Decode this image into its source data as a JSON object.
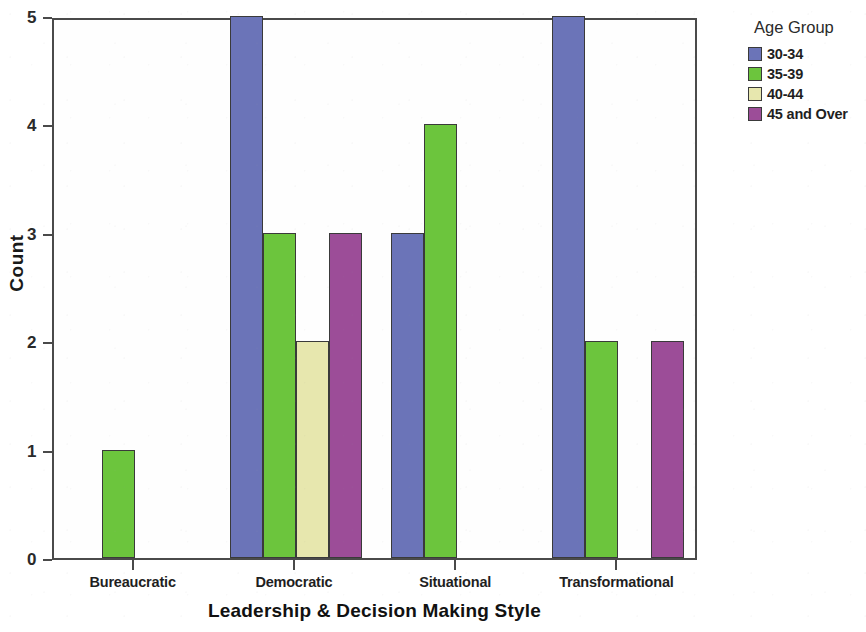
{
  "chart_data": {
    "type": "bar",
    "title": "",
    "subtitle": "",
    "xlabel": "Leadership & Decision Making Style",
    "ylabel": "Count",
    "categories": [
      "Bureaucratic",
      "Democratic",
      "Situational",
      "Transformational"
    ],
    "series": [
      {
        "name": "30-34",
        "color": "#6b74b8",
        "values": [
          0,
          5,
          3,
          5
        ]
      },
      {
        "name": "35-39",
        "color": "#6cc53d",
        "values": [
          1,
          3,
          4,
          2
        ]
      },
      {
        "name": "40-44",
        "color": "#e7e7ae",
        "values": [
          0,
          2,
          0,
          0
        ]
      },
      {
        "name": "45 and Over",
        "color": "#9c4d98",
        "values": [
          0,
          3,
          0,
          2
        ]
      }
    ],
    "ylim": [
      0,
      5
    ],
    "yticks": [
      0,
      1,
      2,
      3,
      4,
      5
    ],
    "ytick_labels": [
      "0",
      "1",
      "2",
      "3",
      "4",
      "5"
    ],
    "grid": false,
    "legend_position": "right",
    "legend_title": "Age Group",
    "bar_border_color": "#3a3a3a",
    "axis_color": "#4a4a4a",
    "background_color": "#ffffff"
  },
  "axes": {
    "y_title": "Count",
    "x_title": "Leadership & Decision Making Style"
  },
  "legend": {
    "title": "Age Group",
    "entries": [
      {
        "label": "30-34",
        "color": "#6b74b8"
      },
      {
        "label": "35-39",
        "color": "#6cc53d"
      },
      {
        "label": "40-44",
        "color": "#e7e7ae"
      },
      {
        "label": "45 and Over",
        "color": "#9c4d98"
      }
    ]
  }
}
